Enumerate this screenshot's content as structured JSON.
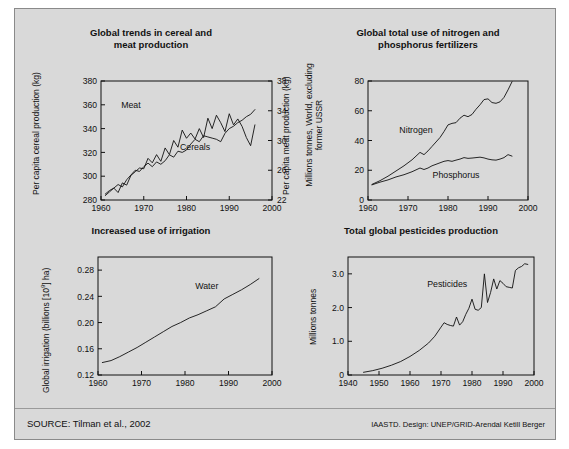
{
  "figure": {
    "background_color": "#d9d9d9",
    "border_color": "#8a8a8a",
    "source_note": "SOURCE: Tilman et al., 2002",
    "credit_note": "IAASTD. Design: UNEP/GRID-Arendal Ketill Berger"
  },
  "chart_data": [
    {
      "id": "cereal-meat",
      "type": "line",
      "title": "Global trends in cereal and meat production",
      "title_line1": "Global trends in cereal and",
      "title_line2": "meat production",
      "xlabel": "",
      "ylabel": "Per capita cereal production (kg)",
      "ylabel_right": "Per capita meat production (kg)",
      "xlim": [
        1960,
        2000
      ],
      "ylim": [
        280,
        380
      ],
      "ylim_right": [
        22,
        38
      ],
      "xticks": [
        1960,
        1970,
        1980,
        1990,
        2000
      ],
      "yticks": [
        280,
        300,
        320,
        340,
        360,
        380
      ],
      "yticks_right": [
        22,
        26,
        30,
        34,
        38
      ],
      "grid": false,
      "legend": "inline-labels",
      "series": [
        {
          "name": "Cereals",
          "axis": "left",
          "label_x": 1982,
          "label_y": 322,
          "x": [
            1961,
            1962,
            1963,
            1964,
            1965,
            1966,
            1967,
            1968,
            1969,
            1970,
            1971,
            1972,
            1973,
            1974,
            1975,
            1976,
            1977,
            1978,
            1979,
            1980,
            1981,
            1982,
            1983,
            1984,
            1985,
            1986,
            1987,
            1988,
            1989,
            1990,
            1991,
            1992,
            1993,
            1994,
            1995,
            1996
          ],
          "values": [
            285,
            288,
            290,
            293,
            291,
            297,
            301,
            305,
            304,
            308,
            311,
            308,
            312,
            310,
            313,
            318,
            316,
            321,
            320,
            322,
            327,
            331,
            329,
            334,
            333,
            332,
            331,
            329,
            336,
            340,
            342,
            345,
            347,
            350,
            352,
            356
          ]
        },
        {
          "name": "Meat",
          "axis": "right",
          "label_x": 1967,
          "label_y": 357,
          "x": [
            1961,
            1962,
            1963,
            1964,
            1965,
            1966,
            1967,
            1968,
            1969,
            1970,
            1971,
            1972,
            1973,
            1974,
            1975,
            1976,
            1977,
            1978,
            1979,
            1980,
            1981,
            1982,
            1983,
            1984,
            1985,
            1986,
            1987,
            1988,
            1989,
            1990,
            1991,
            1992,
            1993,
            1994,
            1995,
            1996
          ],
          "values": [
            22.6,
            23.1,
            23.6,
            23.0,
            24.3,
            24.0,
            25.3,
            25.8,
            26.3,
            26.2,
            27.6,
            27.0,
            28.1,
            27.2,
            29.0,
            28.1,
            30.0,
            29.1,
            31.4,
            30.3,
            31.0,
            30.2,
            31.6,
            30.4,
            33.0,
            31.6,
            33.4,
            32.4,
            31.2,
            33.6,
            32.1,
            32.9,
            31.9,
            30.4,
            29.3,
            32.1
          ]
        }
      ]
    },
    {
      "id": "fertilizers",
      "type": "line",
      "title": "Global total use of nitrogen and phosphorus fertilizers",
      "title_line1": "Global total use of nitrogen and",
      "title_line2": "phosphorus fertilizers",
      "xlabel": "",
      "ylabel": "Millions tonnes, World, excluding former USSR",
      "xlim": [
        1960,
        2000
      ],
      "ylim": [
        0,
        80
      ],
      "xticks": [
        1960,
        1970,
        1980,
        1990,
        2000
      ],
      "yticks": [
        0,
        20,
        40,
        60,
        80
      ],
      "grid": false,
      "legend": "inline-labels",
      "series": [
        {
          "name": "Nitrogen",
          "label_x": 1972,
          "label_y": 45,
          "x": [
            1961,
            1963,
            1965,
            1967,
            1969,
            1971,
            1973,
            1974,
            1975,
            1976,
            1977,
            1978,
            1979,
            1980,
            1981,
            1982,
            1983,
            1984,
            1985,
            1986,
            1987,
            1988,
            1989,
            1990,
            1991,
            1992,
            1993,
            1994,
            1995,
            1996
          ],
          "values": [
            10.5,
            13,
            16,
            19.5,
            23,
            27,
            32,
            30.5,
            33,
            36,
            39,
            42,
            46,
            50.5,
            51.5,
            52,
            55,
            57,
            56,
            57.5,
            61,
            64,
            67.5,
            68,
            65.5,
            65,
            66,
            69,
            74,
            79.5
          ]
        },
        {
          "name": "Phosphorus",
          "label_x": 1982,
          "label_y": 15,
          "x": [
            1961,
            1963,
            1965,
            1967,
            1969,
            1971,
            1973,
            1974,
            1975,
            1976,
            1977,
            1978,
            1979,
            1980,
            1981,
            1982,
            1983,
            1984,
            1985,
            1986,
            1987,
            1988,
            1989,
            1990,
            1991,
            1992,
            1993,
            1994,
            1995,
            1996
          ],
          "values": [
            10.2,
            12,
            13.5,
            15.5,
            17,
            19,
            21.5,
            20.5,
            21.5,
            23,
            24,
            25,
            26,
            26.5,
            26,
            26.8,
            27.5,
            28.5,
            28,
            28.2,
            28.5,
            28.8,
            28.3,
            27.5,
            27,
            26.8,
            27.5,
            28.5,
            30.5,
            29.5
          ]
        }
      ]
    },
    {
      "id": "irrigation",
      "type": "line",
      "title": "Increased use of irrigation",
      "xlabel": "",
      "ylabel": "Global irrigation (billions [10⁹] ha)",
      "xlim": [
        1960,
        2000
      ],
      "ylim": [
        0.12,
        0.3
      ],
      "xticks": [
        1960,
        1970,
        1980,
        1990,
        2000
      ],
      "yticks": [
        0.12,
        0.16,
        0.2,
        0.24,
        0.28
      ],
      "grid": false,
      "legend": "inline-labels",
      "series": [
        {
          "name": "Water",
          "label_x": 1985,
          "label_y": 0.251,
          "x": [
            1961,
            1963,
            1965,
            1967,
            1969,
            1971,
            1973,
            1975,
            1977,
            1979,
            1981,
            1983,
            1985,
            1987,
            1989,
            1991,
            1993,
            1995,
            1997
          ],
          "values": [
            0.139,
            0.142,
            0.148,
            0.155,
            0.162,
            0.17,
            0.178,
            0.186,
            0.194,
            0.2,
            0.207,
            0.212,
            0.218,
            0.224,
            0.236,
            0.243,
            0.25,
            0.258,
            0.267
          ]
        }
      ]
    },
    {
      "id": "pesticides",
      "type": "line",
      "title": "Total global pesticides production",
      "xlabel": "",
      "ylabel": "Millions tonnes",
      "xlim": [
        1940,
        2000
      ],
      "ylim": [
        0,
        3.5
      ],
      "xticks": [
        1940,
        1950,
        1960,
        1970,
        1980,
        1990,
        2000
      ],
      "yticks": [
        0,
        1.0,
        2.0,
        3.0
      ],
      "grid": false,
      "legend": "inline-labels",
      "series": [
        {
          "name": "Pesticides",
          "label_x": 1972,
          "label_y": 2.62,
          "x": [
            1945,
            1948,
            1951,
            1954,
            1957,
            1960,
            1963,
            1966,
            1968,
            1970,
            1971,
            1972,
            1973,
            1974,
            1975,
            1976,
            1977,
            1978,
            1979,
            1980,
            1981,
            1982,
            1983,
            1984,
            1985,
            1986,
            1987,
            1988,
            1989,
            1990,
            1991,
            1992,
            1993,
            1994,
            1995,
            1996,
            1997,
            1998
          ],
          "values": [
            0.08,
            0.13,
            0.2,
            0.29,
            0.4,
            0.55,
            0.73,
            0.95,
            1.15,
            1.42,
            1.55,
            1.5,
            1.47,
            1.45,
            1.72,
            1.48,
            1.58,
            1.8,
            1.98,
            2.25,
            1.95,
            1.92,
            2.0,
            3.0,
            2.15,
            2.45,
            2.85,
            2.55,
            2.8,
            2.72,
            2.62,
            2.6,
            2.58,
            3.1,
            3.18,
            3.22,
            3.3,
            3.28
          ]
        }
      ]
    }
  ]
}
